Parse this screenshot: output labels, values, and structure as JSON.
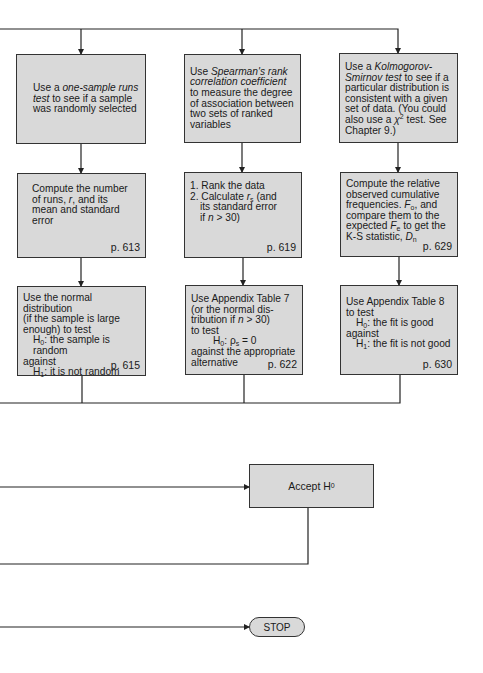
{
  "diagram": {
    "type": "flowchart",
    "row1": [
      {
        "pre": "Use a ",
        "em": "one-sample runs test",
        "post": " to see if a sample was randomly selected"
      },
      {
        "pre": "Use ",
        "em": "Spearman's rank correlation coefficient",
        "post": " to measure the degree of association between two sets of ranked variables"
      },
      {
        "pre": "Use a ",
        "em": "Kolmogorov-Smirnov test",
        "post": " to see if a particular distribution is consistent with a given set of data. (You could also use a ",
        "chi": "χ",
        "chi_sup": "2",
        "post2": " test. See Chapter 9.)"
      }
    ],
    "row2": [
      {
        "l1": "Compute the number",
        "l2a": "of runs, ",
        "l2var": "r",
        "l2b": ", and its",
        "l3": "mean and standard",
        "l4": "error",
        "page": "p. 613"
      },
      {
        "s1": "1. Rank the data",
        "s2a": "2. Calculate ",
        "s2var": "r",
        "s2sub": "s",
        "s2b": " (and",
        "s3": "its standard error",
        "s4a": "if ",
        "s4var": "n",
        "s4b": " > 30)",
        "page": "p. 619"
      },
      {
        "l1": "Compute the relative",
        "l2": "observed cumulative",
        "l3a": "frequencies. ",
        "Fo": "F",
        "Fo_sub": "o",
        "l3b": ", and",
        "l4": "compare them to the",
        "l5a": "expected ",
        "Fe": "F",
        "Fe_sub": "e",
        "l5b": " to get the",
        "l6a": "K-S statistic, ",
        "Dn": "D",
        "Dn_sub": "n",
        "page": "p. 629"
      }
    ],
    "row3": [
      {
        "l1": "Use the normal distribution",
        "l2": "(if the sample is large",
        "l3": "enough) to test",
        "h0": "H",
        "h0sub": "0",
        "h0text": ": the sample is random",
        "against": "against",
        "h1": "H",
        "h1sub": "1",
        "h1text": ": it is not random",
        "page": "p. 615"
      },
      {
        "l1": "Use Appendix Table 7",
        "l2": "(or the normal dis-",
        "l3a": "tribution if ",
        "l3var": "n",
        "l3b": " > 30)",
        "l4": "to test",
        "h0": "H",
        "h0sub": "0",
        "h0text": ": ρ",
        "h0rho_sub": "s",
        "h0eq": " = 0",
        "l6": "against the appropriate",
        "l7": "alternative",
        "page": "p. 622"
      },
      {
        "l1": "Use Appendix Table 8",
        "l2": "to test",
        "h0": "H",
        "h0sub": "0",
        "h0text": ": the fit is good",
        "against": "against",
        "h1": "H",
        "h1sub": "1",
        "h1text": ": the fit is not good",
        "page": "p. 630"
      }
    ],
    "accept": {
      "label": "Accept H",
      "sub": "0"
    },
    "stop": {
      "label": "STOP"
    },
    "colors": {
      "box_fill": "#d9d9d9",
      "line": "#222222"
    }
  }
}
